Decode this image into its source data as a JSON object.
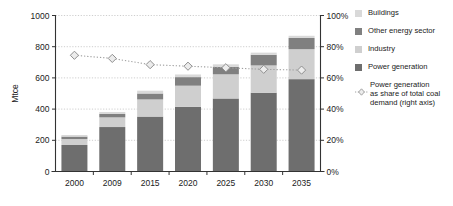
{
  "chart_data": {
    "type": "bar",
    "subtype": "stacked-bar-with-line",
    "title": "",
    "xlabel": "",
    "ylabel": "Mtce",
    "ylabel_right": "",
    "categories": [
      "2000",
      "2009",
      "2015",
      "2020",
      "2025",
      "2030",
      "2035"
    ],
    "ylim": [
      0,
      1000
    ],
    "yticks": [
      0,
      200,
      400,
      600,
      800,
      1000
    ],
    "ytick_labels": [
      "0",
      "200",
      "400",
      "600",
      "800",
      "1000"
    ],
    "ylim_right": [
      0,
      100
    ],
    "yticks_right": [
      0,
      20,
      40,
      60,
      80,
      100
    ],
    "ytick_labels_right": [
      "0%",
      "20%",
      "40%",
      "60%",
      "80%",
      "100%"
    ],
    "grid": true,
    "legend_position": "right",
    "series": [
      {
        "name": "Power generation",
        "color": "#6e6e6e",
        "stack": true,
        "order": 1,
        "values": [
          170,
          285,
          352,
          415,
          468,
          505,
          592
        ]
      },
      {
        "name": "Industry",
        "color": "#cfcfcf",
        "stack": true,
        "order": 2,
        "values": [
          38,
          62,
          110,
          135,
          155,
          175,
          192
        ]
      },
      {
        "name": "Other energy sector",
        "color": "#808080",
        "stack": true,
        "order": 3,
        "values": [
          16,
          22,
          38,
          55,
          48,
          68,
          72
        ]
      },
      {
        "name": "Buildings",
        "color": "#d9d9d9",
        "stack": true,
        "order": 4,
        "values": [
          10,
          12,
          18,
          17,
          16,
          14,
          14
        ]
      }
    ],
    "line_series": {
      "name": "Power generation as share of total coal demand (right axis)",
      "axis": "right",
      "color": "#a0a0a0",
      "marker": "diamond",
      "linestyle": "dotted",
      "values": [
        74.5,
        72.5,
        68.5,
        67.5,
        66.5,
        65.5,
        65.0
      ]
    },
    "totals": [
      234,
      381,
      518,
      622,
      687,
      762,
      870
    ]
  },
  "legend": {
    "items": [
      {
        "label": "Buildings",
        "color": "#d9d9d9"
      },
      {
        "label": "Other energy sector",
        "color": "#808080"
      },
      {
        "label": "Industry",
        "color": "#cfcfcf"
      },
      {
        "label": "Power generation",
        "color": "#6e6e6e"
      }
    ],
    "series_item": {
      "line1": "Power generation",
      "line2": "as share of total coal",
      "line3": "demand (right axis)",
      "color": "#a0a0a0"
    }
  },
  "axes": {
    "left_label": "Mtce",
    "left_ticks": [
      "1000",
      "800",
      "600",
      "400",
      "200",
      "0"
    ],
    "right_ticks": [
      "100%",
      "80%",
      "60%",
      "40%",
      "20%",
      "0%"
    ],
    "categories": [
      "2000",
      "2009",
      "2015",
      "2020",
      "2025",
      "2030",
      "2035"
    ]
  },
  "colors": {
    "power_generation": "#6e6e6e",
    "industry": "#cfcfcf",
    "other_energy_sector": "#808080",
    "buildings": "#d9d9d9",
    "line": "#a0a0a0",
    "axis": "#333333",
    "grid": "#c8c8c8",
    "background": "#ffffff"
  }
}
